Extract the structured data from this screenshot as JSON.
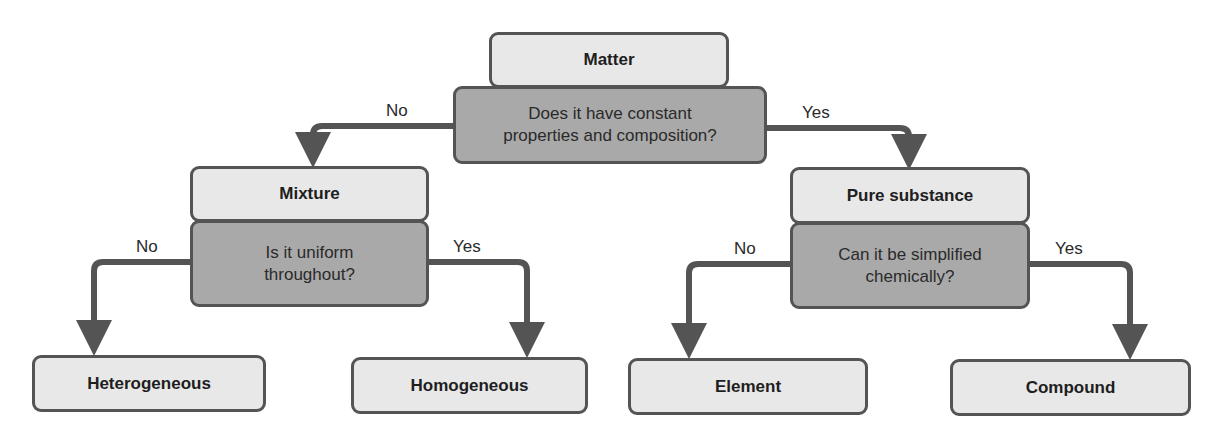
{
  "diagram": {
    "root": {
      "label": "Matter",
      "question": "Does it have constant properties and composition?"
    },
    "question_lines": {
      "q1": [
        "Does it have constant",
        "properties and composition?"
      ],
      "q2": [
        "Is it uniform",
        "throughout?"
      ],
      "q3": [
        "Can it be simplified",
        "chemically?"
      ]
    },
    "nodes": {
      "matter": "Matter",
      "mixture": "Mixture",
      "pure_substance": "Pure substance",
      "heterogeneous": "Heterogeneous",
      "homogeneous": "Homogeneous",
      "element": "Element",
      "compound": "Compound"
    },
    "edge_labels": {
      "q1_no": "No",
      "q1_yes": "Yes",
      "q2_no": "No",
      "q2_yes": "Yes",
      "q3_no": "No",
      "q3_yes": "Yes"
    },
    "edges": [
      {
        "from": "q1",
        "to": "mixture",
        "label": "No"
      },
      {
        "from": "q1",
        "to": "pure_substance",
        "label": "Yes"
      },
      {
        "from": "q2",
        "to": "heterogeneous",
        "label": "No"
      },
      {
        "from": "q2",
        "to": "homogeneous",
        "label": "Yes"
      },
      {
        "from": "q3",
        "to": "element",
        "label": "No"
      },
      {
        "from": "q3",
        "to": "compound",
        "label": "Yes"
      }
    ],
    "colors": {
      "light_box": "#e8e8e8",
      "dark_box": "#a9a9a9",
      "stroke": "#545454"
    }
  }
}
